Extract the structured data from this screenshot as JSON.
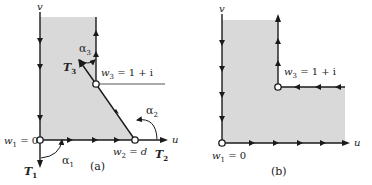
{
  "figures": [
    {
      "id": "a",
      "caption": "(a)",
      "axes": {
        "u": "u",
        "v": "v"
      },
      "points": [
        {
          "name": "w1",
          "label_main": "w",
          "label_sub": "1",
          "label_rest": " = 0"
        },
        {
          "name": "w2",
          "label_main": "w",
          "label_sub": "2",
          "label_rest": " = d"
        },
        {
          "name": "w3",
          "label_main": "w",
          "label_sub": "3",
          "label_rest": " = 1 + i"
        }
      ],
      "tangents": [
        {
          "name": "T1",
          "main": "T",
          "sub": "1"
        },
        {
          "name": "T2",
          "main": "T",
          "sub": "2"
        },
        {
          "name": "T3",
          "main": "T",
          "sub": "3"
        }
      ],
      "angles": [
        {
          "name": "alpha1",
          "main": "α",
          "sub": "1"
        },
        {
          "name": "alpha2",
          "main": "α",
          "sub": "2"
        },
        {
          "name": "alpha3",
          "main": "α",
          "sub": "3"
        }
      ]
    },
    {
      "id": "b",
      "caption": "(b)",
      "axes": {
        "u": "u",
        "v": "v"
      },
      "points": [
        {
          "name": "w1",
          "label_main": "w",
          "label_sub": "1",
          "label_rest": " = 0"
        },
        {
          "name": "w3",
          "label_main": "w",
          "label_sub": "3",
          "label_rest": " = 1 + i"
        }
      ]
    }
  ],
  "colors": {
    "region": "#d9d9d9",
    "line": "#1a1a1a",
    "text": "#222222"
  }
}
